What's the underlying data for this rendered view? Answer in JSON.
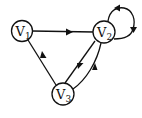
{
  "diagram": {
    "type": "directed-graph",
    "nodes": [
      {
        "id": "v1",
        "letter": "V",
        "sub": "1",
        "label": "V1"
      },
      {
        "id": "v2",
        "letter": "V",
        "sub": "2",
        "label": "V2"
      },
      {
        "id": "v3",
        "letter": "V",
        "sub": "3",
        "label": "V3"
      }
    ],
    "edges": [
      {
        "from": "V1",
        "to": "V2"
      },
      {
        "from": "V2",
        "to": "V2",
        "kind": "self-loop"
      },
      {
        "from": "V2",
        "to": "V3"
      },
      {
        "from": "V3",
        "to": "V2"
      },
      {
        "from": "V3",
        "to": "V1"
      }
    ],
    "colors": {
      "stroke": "#111111",
      "background": "#ffffff"
    }
  }
}
